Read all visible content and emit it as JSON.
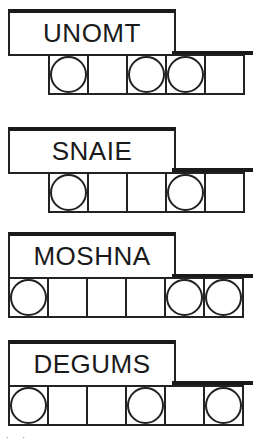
{
  "puzzles": [
    {
      "scrambled": "UNOMT",
      "cells": 5,
      "circled": [
        0,
        2,
        3
      ],
      "top": 9,
      "cell_left": 48
    },
    {
      "scrambled": "SNAIE",
      "cells": 5,
      "circled": [
        0,
        3
      ],
      "top": 127,
      "cell_left": 48
    },
    {
      "scrambled": "MOSHNA",
      "cells": 6,
      "circled": [
        0,
        4,
        5
      ],
      "top": 232,
      "cell_left": 8
    },
    {
      "scrambled": "DEGUMS",
      "cells": 6,
      "circled": [
        0,
        3,
        5
      ],
      "top": 340,
      "cell_left": 8
    }
  ],
  "footer_marks": ". ."
}
